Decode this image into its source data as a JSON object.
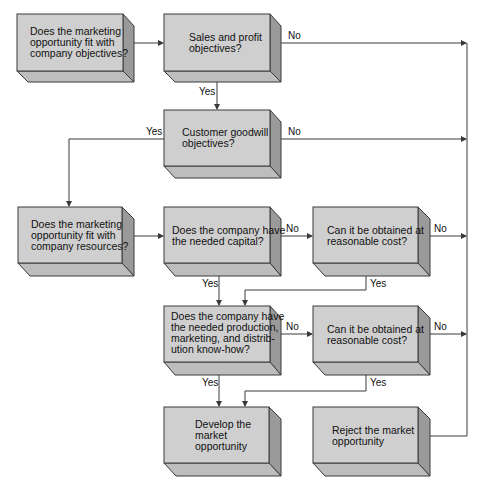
{
  "diagram": {
    "type": "flowchart",
    "colors": {
      "box_front": "#cfcfcf",
      "box_side": "#9a9a9a",
      "box_bottom": "#bdbdbd",
      "line": "#3a3a3a"
    },
    "nodes": [
      {
        "id": "fit-objectives",
        "lines": [
          "Does the marketing",
          "opportunity fit with",
          "company objectives?"
        ]
      },
      {
        "id": "sales-profit",
        "lines": [
          "Sales and profit",
          "objectives?"
        ]
      },
      {
        "id": "customer-goodwill",
        "lines": [
          "Customer goodwill",
          "objectives?"
        ]
      },
      {
        "id": "fit-resources",
        "lines": [
          "Does the marketing",
          "opportunity fit with",
          "company resources?"
        ]
      },
      {
        "id": "needed-capital",
        "lines": [
          "Does the company have",
          "the needed capital?"
        ]
      },
      {
        "id": "capital-reasonable-cost",
        "lines": [
          "Can it be obtained at",
          "reasonable cost?"
        ]
      },
      {
        "id": "needed-knowhow",
        "lines": [
          "Does the company have",
          "the needed production,",
          "marketing, and distrib-",
          "ution know-how?"
        ]
      },
      {
        "id": "knowhow-reasonable-cost",
        "lines": [
          "Can it be obtained at",
          "reasonable cost?"
        ]
      },
      {
        "id": "develop",
        "lines": [
          "Develop the",
          "market",
          "opportunity"
        ]
      },
      {
        "id": "reject",
        "lines": [
          "Reject the market",
          "opportunity"
        ]
      }
    ],
    "edges": [
      {
        "from": "fit-objectives",
        "to": "sales-profit",
        "label": ""
      },
      {
        "from": "sales-profit",
        "to": "reject",
        "label": "No"
      },
      {
        "from": "sales-profit",
        "to": "customer-goodwill",
        "label": "Yes"
      },
      {
        "from": "customer-goodwill",
        "to": "reject",
        "label": "No"
      },
      {
        "from": "customer-goodwill",
        "to": "fit-resources",
        "label": "Yes"
      },
      {
        "from": "fit-resources",
        "to": "needed-capital",
        "label": ""
      },
      {
        "from": "needed-capital",
        "to": "capital-reasonable-cost",
        "label": "No"
      },
      {
        "from": "needed-capital",
        "to": "needed-knowhow",
        "label": "Yes"
      },
      {
        "from": "capital-reasonable-cost",
        "to": "reject",
        "label": "No"
      },
      {
        "from": "capital-reasonable-cost",
        "to": "needed-knowhow",
        "label": "Yes"
      },
      {
        "from": "needed-knowhow",
        "to": "knowhow-reasonable-cost",
        "label": "No"
      },
      {
        "from": "needed-knowhow",
        "to": "develop",
        "label": "Yes"
      },
      {
        "from": "knowhow-reasonable-cost",
        "to": "reject",
        "label": "No"
      },
      {
        "from": "knowhow-reasonable-cost",
        "to": "develop",
        "label": "Yes"
      }
    ],
    "labels": {
      "yes": "Yes",
      "no": "No"
    }
  }
}
